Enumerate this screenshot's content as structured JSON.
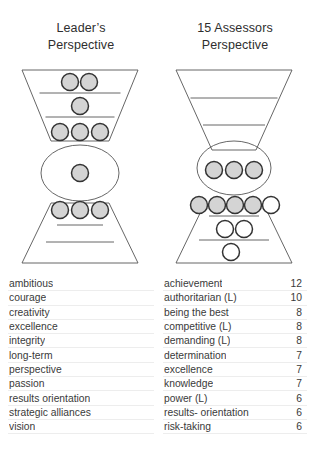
{
  "panels": {
    "left": {
      "title_line1": "Leader’s",
      "title_line2": "Perspective",
      "diagram": {
        "name": "leader-funnel",
        "filled_color": "#d4d4d4",
        "empty_color": "#ffffff",
        "outline_color": "#3a3a3a",
        "rows": [
          {
            "zone": "top-cone-band-1",
            "filled": 2,
            "empty": 0
          },
          {
            "zone": "top-cone-band-2",
            "filled": 1,
            "empty": 0
          },
          {
            "zone": "top-cone-band-3",
            "filled": 3,
            "empty": 0
          },
          {
            "zone": "center-ellipse",
            "filled": 1,
            "empty": 0
          },
          {
            "zone": "lower-cone-band-1",
            "filled": 3,
            "empty": 0
          },
          {
            "zone": "lower-cone-band-2",
            "filled": 0,
            "empty": 0
          },
          {
            "zone": "lower-cone-band-3",
            "filled": 0,
            "empty": 0
          }
        ]
      },
      "items": [
        {
          "label": "ambitious",
          "value": ""
        },
        {
          "label": "courage",
          "value": ""
        },
        {
          "label": "creativity",
          "value": ""
        },
        {
          "label": "excellence",
          "value": ""
        },
        {
          "label": "integrity",
          "value": ""
        },
        {
          "label": "long-term",
          "value": ""
        },
        {
          "label": "perspective",
          "value": ""
        },
        {
          "label": "passion",
          "value": ""
        },
        {
          "label": "results orientation",
          "value": ""
        },
        {
          "label": "strategic alliances",
          "value": ""
        },
        {
          "label": "vision",
          "value": ""
        }
      ]
    },
    "right": {
      "title_line1": "15 Assessors",
      "title_line2": "Perspective",
      "diagram": {
        "name": "assessors-funnel",
        "filled_color": "#d4d4d4",
        "empty_color": "#ffffff",
        "outline_color": "#3a3a3a",
        "rows": [
          {
            "zone": "top-cone-band-1",
            "filled": 0,
            "empty": 0
          },
          {
            "zone": "top-cone-band-2",
            "filled": 0,
            "empty": 0
          },
          {
            "zone": "top-cone-band-3",
            "filled": 0,
            "empty": 0
          },
          {
            "zone": "center-ellipse",
            "filled": 3,
            "empty": 0
          },
          {
            "zone": "lower-cone-band-1",
            "filled": 4,
            "empty": 1
          },
          {
            "zone": "lower-cone-band-2",
            "filled": 0,
            "empty": 2
          },
          {
            "zone": "lower-cone-band-3",
            "filled": 0,
            "empty": 1
          }
        ]
      },
      "items": [
        {
          "label": "achievement",
          "value": "12"
        },
        {
          "label": "authoritarian  (L)",
          "value": "10"
        },
        {
          "label": "being the best",
          "value": "8"
        },
        {
          "label": "competitive  (L)",
          "value": "8"
        },
        {
          "label": "demanding (L)",
          "value": "8"
        },
        {
          "label": "determination",
          "value": "7"
        },
        {
          "label": "excellence",
          "value": "7"
        },
        {
          "label": "knowledge",
          "value": "7"
        },
        {
          "label": "power (L)",
          "value": "6"
        },
        {
          "label": "results- orientation",
          "value": "6"
        },
        {
          "label": "risk-taking",
          "value": "6"
        }
      ]
    }
  }
}
